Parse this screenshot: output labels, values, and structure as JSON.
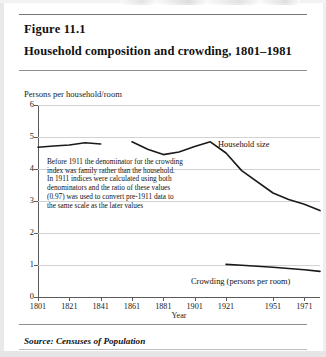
{
  "figure": {
    "number": "Figure 11.1",
    "title": "Household composition and crowding, 1801–1981",
    "source": "Source: Censuses of Population"
  },
  "annotation": {
    "line1": "Before 1911 the denominator for the crowding",
    "line2": "index was family rather than the household.",
    "line3": "In 1911 indices were calculated using both",
    "line4": "denominators and the ratio of these values",
    "line5": "(0.97) was used to convert pre-1911 data to",
    "line6": "the same scale as the later values"
  },
  "labels": {
    "household_size": "Household size",
    "crowding": "Crowding (persons per room)"
  },
  "chart_data": {
    "type": "line",
    "title": "Household composition and crowding, 1801–1981",
    "subtitle": "",
    "xlabel": "Year",
    "ylabel": "Persons per household/room",
    "ylim": [
      0,
      6
    ],
    "xlim": [
      1801,
      1981
    ],
    "yticks": [
      "0",
      "1",
      "2",
      "3",
      "4",
      "5",
      "6"
    ],
    "xticks": [
      "1801",
      "1821",
      "1841",
      "1861",
      "1881",
      "1901",
      "1921",
      "1951",
      "1971"
    ],
    "grid": true,
    "legend_position": "inline-annotation",
    "series": [
      {
        "name": "Household size",
        "units": "persons per household",
        "segments": [
          {
            "note": "pre-1911 segment A",
            "x": [
              1801,
              1811,
              1821,
              1831,
              1841
            ],
            "values": [
              4.68,
              4.72,
              4.75,
              4.82,
              4.78
            ]
          },
          {
            "note": "pre-1911 segment B",
            "x": [
              1861,
              1871,
              1881,
              1891,
              1901,
              1911,
              1921,
              1931,
              1951,
              1961,
              1971,
              1981
            ],
            "values": [
              4.85,
              4.62,
              4.45,
              4.53,
              4.7,
              4.85,
              4.5,
              3.95,
              3.25,
              3.05,
              2.9,
              2.7
            ]
          }
        ]
      },
      {
        "name": "Crowding (persons per room)",
        "units": "persons per room",
        "segments": [
          {
            "note": "post-1911 crowding",
            "x": [
              1921,
              1931,
              1951,
              1961,
              1971,
              1981
            ],
            "values": [
              1.02,
              0.99,
              0.93,
              0.89,
              0.85,
              0.8
            ]
          }
        ]
      }
    ]
  }
}
